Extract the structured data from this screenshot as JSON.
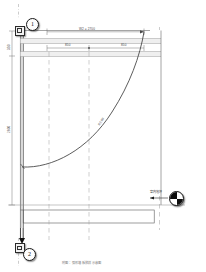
{
  "drawing": {
    "type": "cad-section-elevation",
    "title_visible": false,
    "background": "#ffffff",
    "line_color": "#5a5a5a",
    "heavy_line_color": "#2b2b2b",
    "dash_color": "#9a9a9a"
  },
  "callouts": [
    {
      "id": "1",
      "label": "1",
      "position": "top-left"
    },
    {
      "id": "2",
      "label": "2",
      "position": "bottom-left"
    }
  ],
  "dimensions": {
    "top_overall": "W2 = 2700",
    "top_segment_left": "850",
    "top_segment_right": "850",
    "left_upper": "350",
    "left_main": "2600"
  },
  "annotations": {
    "arc_label": "R2,00",
    "level_label": "室内地坪"
  },
  "footer": {
    "caption": "附图：弧形墙板放样示意图"
  },
  "markers": {
    "level_symbol": "level-quartered-circle"
  }
}
